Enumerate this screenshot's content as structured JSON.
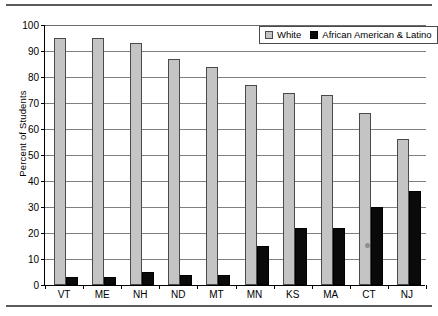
{
  "chart_data": {
    "type": "bar",
    "title": "",
    "xlabel": "",
    "ylabel": "Percent of Students",
    "ylim": [
      0,
      100
    ],
    "ytick_step": 10,
    "yticks": [
      0,
      10,
      20,
      30,
      40,
      50,
      60,
      70,
      80,
      90,
      100
    ],
    "grid": true,
    "legend_position": "top-right",
    "categories": [
      "VT",
      "ME",
      "NH",
      "ND",
      "MT",
      "MN",
      "KS",
      "MA",
      "CT",
      "NJ"
    ],
    "series": [
      {
        "name": "White",
        "color": "#c4c4c4",
        "values": [
          95,
          95,
          93,
          87,
          84,
          77,
          74,
          73,
          66,
          56
        ]
      },
      {
        "name": "African American & Latino",
        "color": "#0a0a0a",
        "values": [
          3,
          3,
          5,
          4,
          4,
          15,
          22,
          22,
          30,
          36
        ]
      }
    ]
  },
  "legend": {
    "items": [
      {
        "label": "White",
        "swatch": "white-swatch"
      },
      {
        "label": "African American & Latino",
        "swatch": "black-swatch"
      }
    ]
  }
}
